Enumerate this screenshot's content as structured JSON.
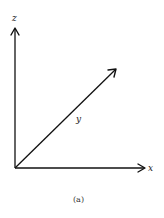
{
  "diagram": {
    "type": "3d-coordinate-axes",
    "axes": {
      "z": {
        "label": "z"
      },
      "y": {
        "label": "y"
      },
      "x": {
        "label": "x"
      }
    },
    "caption": "(a)",
    "colors": {
      "stroke": "#111111",
      "background": "#ffffff"
    }
  }
}
